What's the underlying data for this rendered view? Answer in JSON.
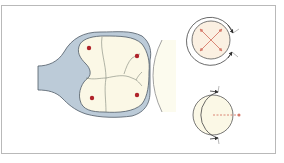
{
  "figure": {
    "type": "scientific-illustration",
    "panels": [
      {
        "id": "embryo-cross-section",
        "description": "Multi-cell mass enclosed in a blue-gray cup-shaped sheath with a stalk to the left, abutting a pale curved surface on the right",
        "cell_nuclei_count": 4
      },
      {
        "id": "radial-expansion-circle",
        "description": "Circle with red diagonal cross arrows and an outer arc with two arrowheads on the right"
      },
      {
        "id": "directional-circle",
        "description": "Circle with a left-side outer arc bearing arrowheads top and bottom, and a red dashed line pointing right"
      }
    ]
  },
  "colors": {
    "frame_border": "#b9b9b9",
    "sheath_fill": "#bccbd8",
    "sheath_stroke": "#4f5b66",
    "cell_fill": "#fbf8e6",
    "cell_line": "#7e8478",
    "nucleus": "#b0232a",
    "arrow_red": "#d6796a",
    "outline": "#555555",
    "pale_surface": "#fcfbee"
  }
}
